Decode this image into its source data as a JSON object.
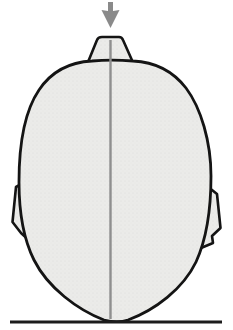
{
  "figure": {
    "icons": [
      "down-arrow-icon"
    ],
    "text_labels": []
  },
  "colors": {
    "background": "#ffffff",
    "head_fill": "#ebebe9",
    "stipple_dot": "#dddddb",
    "outline": "#141414",
    "midline": "#8f8f8f",
    "arrow": "#8a8a8a",
    "ground_line": "#1c1c1c"
  }
}
